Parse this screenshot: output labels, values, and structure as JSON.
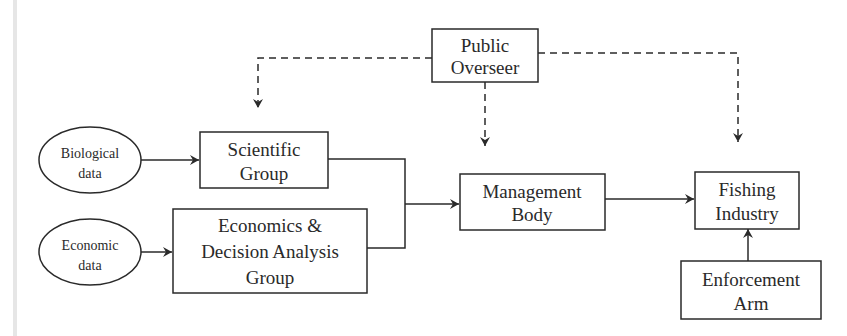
{
  "diagram": {
    "type": "flowchart",
    "nodes": {
      "public_overseer": {
        "line1": "Public",
        "line2": "Overseer"
      },
      "biological_data": {
        "line1": "Biological",
        "line2": "data"
      },
      "economic_data": {
        "line1": "Economic",
        "line2": "data"
      },
      "scientific_group": {
        "line1": "Scientific",
        "line2": "Group"
      },
      "econ_group": {
        "line1": "Economics &",
        "line2": "Decision Analysis",
        "line3": "Group"
      },
      "management_body": {
        "line1": "Management",
        "line2": "Body"
      },
      "fishing_industry": {
        "line1": "Fishing",
        "line2": "Industry"
      },
      "enforcement_arm": {
        "line1": "Enforcement",
        "line2": "Arm"
      }
    },
    "edges": [
      {
        "from": "Biological data",
        "to": "Scientific Group",
        "style": "solid"
      },
      {
        "from": "Economic data",
        "to": "Economics & Decision Analysis Group",
        "style": "solid"
      },
      {
        "from": "Scientific Group",
        "to": "Management Body",
        "style": "solid"
      },
      {
        "from": "Economics & Decision Analysis Group",
        "to": "Management Body",
        "style": "solid"
      },
      {
        "from": "Management Body",
        "to": "Fishing Industry",
        "style": "solid"
      },
      {
        "from": "Enforcement Arm",
        "to": "Fishing Industry",
        "style": "solid"
      },
      {
        "from": "Public Overseer",
        "to": "Scientific Group",
        "style": "dashed"
      },
      {
        "from": "Public Overseer",
        "to": "Management Body",
        "style": "dashed"
      },
      {
        "from": "Public Overseer",
        "to": "Fishing Industry",
        "style": "dashed"
      }
    ]
  }
}
